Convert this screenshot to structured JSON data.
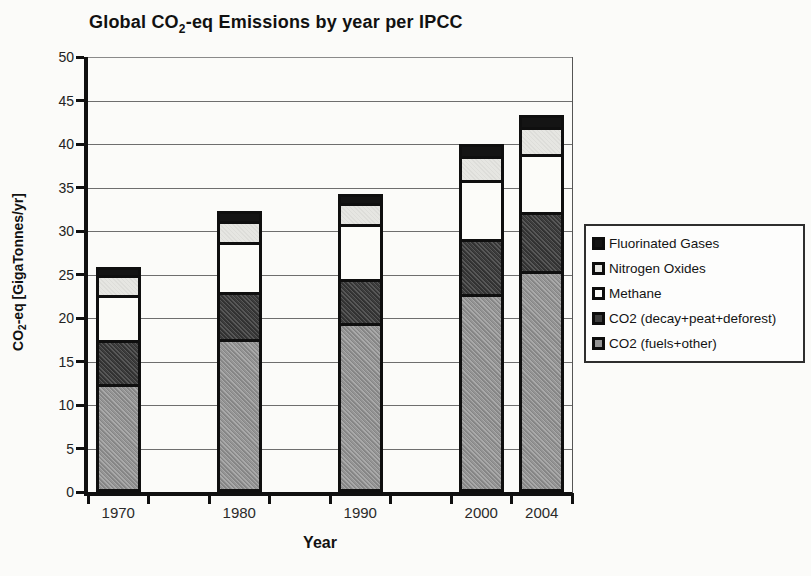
{
  "title": {
    "prefix": "Global CO",
    "subscript": "2",
    "suffix": "-eq Emissions by year per IPCC"
  },
  "y_axis": {
    "label_prefix": "CO",
    "label_subscript": "2",
    "label_suffix": "-eq [GigaTonnes/yr]"
  },
  "x_axis": {
    "label": "Year"
  },
  "chart_data": {
    "type": "bar",
    "stacked": true,
    "title": "Global CO2-eq Emissions by year per IPCC",
    "xlabel": "Year",
    "ylabel": "CO2-eq [GigaTonnes/yr]",
    "ylim": [
      0,
      50
    ],
    "ytick_step": 5,
    "ytick_labels": [
      "0",
      "5",
      "10",
      "15",
      "20",
      "25",
      "30",
      "35",
      "40",
      "45",
      "50"
    ],
    "grid": true,
    "legend_position": "right",
    "categories": [
      "1970",
      "1980",
      "1990",
      "2000",
      "2004"
    ],
    "series": [
      {
        "name": "CO2 (fuels+other)",
        "color": "#949494",
        "values": [
          12.8,
          18.1,
          20.0,
          23.3,
          25.9
        ]
      },
      {
        "name": "CO2 (decay+peat+deforest)",
        "color": "#3c3c3c",
        "values": [
          5.1,
          5.3,
          4.9,
          6.3,
          6.8
        ]
      },
      {
        "name": "Methane",
        "color": "#fcfcf9",
        "values": [
          5.2,
          5.8,
          6.4,
          6.8,
          6.7
        ]
      },
      {
        "name": "Nitrogen Oxides",
        "color": "#e6e6e2",
        "values": [
          2.1,
          2.3,
          2.2,
          2.5,
          2.8
        ]
      },
      {
        "name": "Fluorinated Gases",
        "color": "#141414",
        "values": [
          0.7,
          0.8,
          0.8,
          1.1,
          1.1
        ]
      }
    ],
    "totals": [
      25.9,
      32.3,
      34.3,
      40.0,
      43.3
    ],
    "layout_hints": {
      "category_slots": [
        0,
        2,
        4,
        6,
        7
      ],
      "num_slots": 8,
      "bar_width_px": 45
    }
  }
}
